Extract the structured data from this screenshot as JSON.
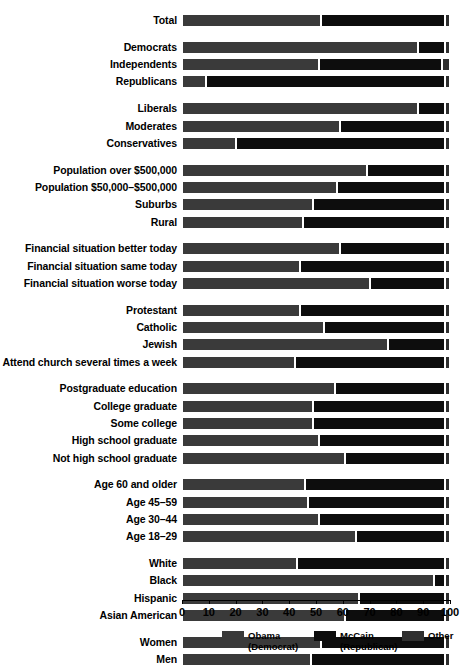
{
  "chart_data": {
    "type": "bar",
    "orientation": "horizontal",
    "stacked": true,
    "title": "",
    "xlabel": "",
    "ylabel": "",
    "xlim": [
      0,
      100
    ],
    "grid": false,
    "legend_position": "bottom",
    "series": [
      {
        "name": "Obama",
        "sublabel": "(Democrat)",
        "color": "#3a3a3a"
      },
      {
        "name": "McCain",
        "sublabel": "(Republican)",
        "color": "#0d0d0d"
      },
      {
        "name": "Other",
        "sublabel": "",
        "color": "#2f2f2f"
      }
    ],
    "xticks": [
      0,
      10,
      20,
      30,
      40,
      50,
      60,
      70,
      80,
      90,
      100
    ],
    "xticklabels": [
      "0",
      "10",
      "20",
      "30",
      "40",
      "50",
      "60",
      "70",
      "80",
      "90",
      "100"
    ],
    "groups": [
      {
        "name": "total",
        "rows": [
          {
            "label": "Total",
            "obama": 52,
            "mccain": 46,
            "other": 2
          }
        ]
      },
      {
        "name": "party",
        "rows": [
          {
            "label": "Democrats",
            "obama": 88,
            "mccain": 10,
            "other": 2
          },
          {
            "label": "Independents",
            "obama": 51,
            "mccain": 46,
            "other": 3
          },
          {
            "label": "Republicans",
            "obama": 9,
            "mccain": 89,
            "other": 2
          }
        ]
      },
      {
        "name": "ideology",
        "rows": [
          {
            "label": "Liberals",
            "obama": 88,
            "mccain": 10,
            "other": 2
          },
          {
            "label": "Moderates",
            "obama": 59,
            "mccain": 39,
            "other": 2
          },
          {
            "label": "Conservatives",
            "obama": 20,
            "mccain": 78,
            "other": 2
          }
        ]
      },
      {
        "name": "community-size",
        "rows": [
          {
            "label": "Population over $500,000",
            "obama": 69,
            "mccain": 29,
            "other": 2
          },
          {
            "label": "Population $50,000–$500,000",
            "obama": 58,
            "mccain": 40,
            "other": 2
          },
          {
            "label": "Suburbs",
            "obama": 49,
            "mccain": 49,
            "other": 2
          },
          {
            "label": "Rural",
            "obama": 45,
            "mccain": 53,
            "other": 2
          }
        ]
      },
      {
        "name": "financial-situation",
        "rows": [
          {
            "label": "Financial situation better today",
            "obama": 59,
            "mccain": 39,
            "other": 2
          },
          {
            "label": "Financial situation same today",
            "obama": 44,
            "mccain": 54,
            "other": 2
          },
          {
            "label": "Financial situation worse today",
            "obama": 70,
            "mccain": 28,
            "other": 2
          }
        ]
      },
      {
        "name": "religion",
        "rows": [
          {
            "label": "Protestant",
            "obama": 44,
            "mccain": 54,
            "other": 2
          },
          {
            "label": "Catholic",
            "obama": 53,
            "mccain": 45,
            "other": 2
          },
          {
            "label": "Jewish",
            "obama": 77,
            "mccain": 21,
            "other": 2
          },
          {
            "label": "Attend church several times a week",
            "obama": 42,
            "mccain": 56,
            "other": 2
          }
        ]
      },
      {
        "name": "education",
        "rows": [
          {
            "label": "Postgraduate education",
            "obama": 57,
            "mccain": 41,
            "other": 2
          },
          {
            "label": "College graduate",
            "obama": 49,
            "mccain": 49,
            "other": 2
          },
          {
            "label": "Some college",
            "obama": 49,
            "mccain": 49,
            "other": 2
          },
          {
            "label": "High school graduate",
            "obama": 51,
            "mccain": 47,
            "other": 2
          },
          {
            "label": "Not high school graduate",
            "obama": 61,
            "mccain": 37,
            "other": 2
          }
        ]
      },
      {
        "name": "age",
        "rows": [
          {
            "label": "Age 60 and older",
            "obama": 46,
            "mccain": 52,
            "other": 2
          },
          {
            "label": "Age 45–59",
            "obama": 47,
            "mccain": 51,
            "other": 2
          },
          {
            "label": "Age 30–44",
            "obama": 51,
            "mccain": 47,
            "other": 2
          },
          {
            "label": "Age 18–29",
            "obama": 65,
            "mccain": 33,
            "other": 2
          }
        ]
      },
      {
        "name": "race",
        "rows": [
          {
            "label": "White",
            "obama": 43,
            "mccain": 55,
            "other": 2
          },
          {
            "label": "Black",
            "obama": 94,
            "mccain": 4,
            "other": 2
          },
          {
            "label": "Hispanic",
            "obama": 66,
            "mccain": 32,
            "other": 2
          },
          {
            "label": "Asian American",
            "obama": 61,
            "mccain": 37,
            "other": 2
          }
        ]
      },
      {
        "name": "gender",
        "rows": [
          {
            "label": "Women",
            "obama": 52,
            "mccain": 46,
            "other": 2
          },
          {
            "label": "Men",
            "obama": 48,
            "mccain": 50,
            "other": 2
          }
        ]
      }
    ]
  }
}
